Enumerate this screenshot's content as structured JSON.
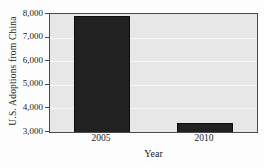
{
  "chart_data": {
    "type": "bar",
    "title": "",
    "xlabel": "Year",
    "ylabel": "U.S. Adoptions from China",
    "categories": [
      "2005",
      "2010"
    ],
    "values": [
      7900,
      3400
    ],
    "ylim": [
      3000,
      8000
    ],
    "ytick_step": 1000,
    "ytick_labels": [
      "3,000",
      "4,000",
      "5,000",
      "6,000",
      "7,000",
      "8,000"
    ],
    "grid": "horizontal-white-gridlines",
    "legend": "none",
    "colors": {
      "bar": "#212121",
      "bar_border": "#0d0d0d",
      "plot_background": "#e7e7e7",
      "gridline": "#f8f8f8",
      "axis_border": "#4a4a4a",
      "text": "#222222"
    }
  }
}
